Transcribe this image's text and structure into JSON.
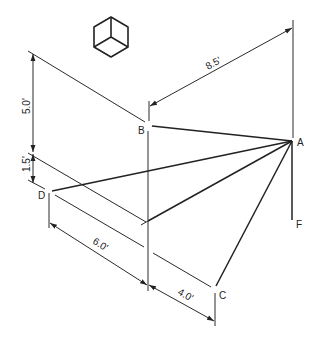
{
  "diagram": {
    "type": "isometric technical drawing",
    "icon": "isometric-cube-icon",
    "points": {
      "A": {
        "label": "A",
        "x": 292,
        "y": 141
      },
      "B": {
        "label": "B",
        "x": 149,
        "y": 126
      },
      "C": {
        "label": "C",
        "x": 215,
        "y": 288
      },
      "D": {
        "label": "D",
        "x": 49,
        "y": 191
      },
      "F": {
        "label": "F",
        "x": 292,
        "y": 220
      },
      "O": {
        "x": 148,
        "y": 221
      }
    },
    "dimensions": {
      "ab_horizontal": "8.5'",
      "vertical_upper": "5.0'",
      "vertical_lower": "1.5'",
      "d_to_o": "6.0'",
      "o_to_c": "4.0'"
    },
    "colors": {
      "line": "#222222",
      "background": "#ffffff"
    }
  }
}
